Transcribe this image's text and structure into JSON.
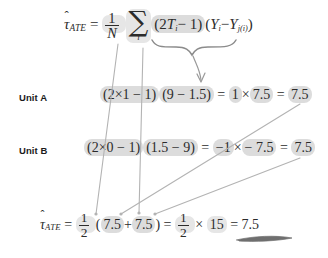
{
  "slide": {
    "title": "ATE estimator worked example",
    "background_color": "#ffffff",
    "text_color": "#2b2b2b",
    "highlight_color": "#dcdcdc"
  },
  "formula_main": {
    "estimator_symbol": "τ",
    "estimator_hat": "ˆ",
    "estimator_subscript": "ATE",
    "equals": "=",
    "fraction_numerator": "1",
    "fraction_denominator": "N",
    "sum_symbol": "∑",
    "sum_index": "i",
    "open_paren": "(",
    "two": "2",
    "treatment_symbol": "T",
    "treatment_subscript": "i",
    "minus_one": "− 1",
    "close_paren": ")",
    "outcome_symbol": "Y",
    "outcome_subscript": "i",
    "minus": "−",
    "match_symbol": "Y",
    "match_subscript": "j(i)",
    "full_text": "τ̂_ATE = (1/N) ∑_i (2T_i − 1)(Y_i − Y_j(i))"
  },
  "unit_a": {
    "label": "Unit A",
    "sign_term": "(2×1 − 1)",
    "diff_term": "(9 − 1.5)",
    "equals": "=",
    "sign_value": "1",
    "times": "×",
    "diff_value": "7.5",
    "equals2": "=",
    "result": "7.5",
    "full_text": "(2×1 − 1)(9 − 1.5) = 1×7.5 = 7.5"
  },
  "unit_b": {
    "label": "Unit B",
    "sign_term": "(2×0 − 1)",
    "diff_term": "(1.5 − 9)",
    "equals": "=",
    "sign_value": "−1",
    "times": "×",
    "diff_value": "− 7.5",
    "equals2": "=",
    "result": "7.5",
    "full_text": "(2×0 − 1)(1.5 − 9) = −1× − 7.5 = 7.5"
  },
  "formula_final": {
    "estimator_symbol": "τ",
    "estimator_hat": "ˆ",
    "estimator_subscript": "ATE",
    "equals": "=",
    "fraction_numerator": "1",
    "fraction_denominator": "2",
    "open_paren": "(",
    "term_a": "7.5",
    "plus": "+",
    "term_b": "7.5",
    "close_paren": ")",
    "equals2": "=",
    "fraction2_numerator": "1",
    "fraction2_denominator": "2",
    "times": "×",
    "sum_value": "15",
    "equals3": "=",
    "result": "7.5",
    "full_text": "τ̂_ATE = (1/2)(7.5 + 7.5) = (1/2) × 15 = 7.5"
  },
  "annotations": {
    "brace_label": "product-term-brace",
    "arrow_brace_to_units": "arrow from product term down to unit examples",
    "arrow_n_to_half": "arrow from 1/N down to 1/2",
    "arrow_sum_to_sum": "arrow from summation down to sum of terms",
    "arrow_unit_a_result": "arrow from Unit A result to final first term",
    "arrow_unit_b_result": "arrow from Unit B result to final second term",
    "underline_final": "hand-drawn underline under final result"
  }
}
